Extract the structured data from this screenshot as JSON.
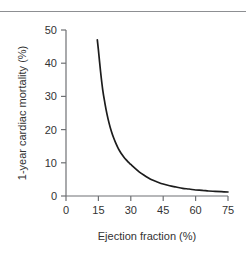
{
  "figure": {
    "background_color": "#ffffff",
    "rule_color": "#8d8f92",
    "text_color": "#333333"
  },
  "chart_data": {
    "type": "line",
    "title": "",
    "subtitle": "",
    "xlabel": "Ejection fraction (%)",
    "ylabel": "1-year cardiac mortality (%)",
    "xlim": [
      0,
      75
    ],
    "ylim": [
      0,
      50
    ],
    "xticks": [
      0,
      15,
      30,
      45,
      60,
      75
    ],
    "yticks": [
      0,
      10,
      20,
      30,
      40,
      50
    ],
    "xtick_labels": [
      "0",
      "15",
      "30",
      "45",
      "60",
      "75"
    ],
    "ytick_labels": [
      "0",
      "10",
      "20",
      "30",
      "40",
      "50"
    ],
    "grid": false,
    "legend": null,
    "legend_position": "none",
    "annotations": [],
    "series": [
      {
        "name": "1-year cardiac mortality",
        "color": "#1c1c1c",
        "line_width": 1.7,
        "x": [
          14.5,
          15,
          16,
          17,
          18,
          19,
          20,
          21,
          22,
          23,
          24,
          25,
          26,
          27,
          28,
          29,
          30,
          32,
          34,
          36,
          38,
          40,
          42,
          45,
          48,
          51,
          54,
          57,
          60,
          63,
          66,
          69,
          72,
          75
        ],
        "y": [
          47.0,
          44.0,
          37.5,
          32.0,
          28.0,
          24.6,
          21.8,
          19.5,
          17.6,
          16.0,
          14.6,
          13.4,
          12.4,
          11.5,
          10.8,
          10.1,
          9.5,
          8.3,
          7.2,
          6.3,
          5.5,
          4.8,
          4.3,
          3.6,
          3.1,
          2.7,
          2.3,
          2.1,
          1.8,
          1.7,
          1.5,
          1.4,
          1.3,
          1.2
        ]
      }
    ]
  }
}
